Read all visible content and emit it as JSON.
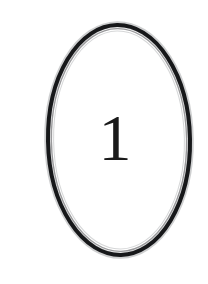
{
  "figure": {
    "kind": "numbered-oval",
    "label": "1",
    "background_color": "#ffffff",
    "canvas": {
      "width": 208,
      "height": 284
    },
    "oval": {
      "shape": "ellipse",
      "center_x": 119,
      "center_y": 140,
      "radius_x": 71,
      "radius_y": 115,
      "stroke_color": "#17181a",
      "stroke_width": 4,
      "inner_line_color": "#9a9a9c",
      "inner_line_width": 1.4,
      "fill": "none",
      "rotation_deg": -1
    },
    "numeral": {
      "text": "1",
      "color": "#1a1a1a",
      "style": "serif",
      "center_x": 115,
      "center_y": 138,
      "width": 25,
      "height": 50
    }
  }
}
